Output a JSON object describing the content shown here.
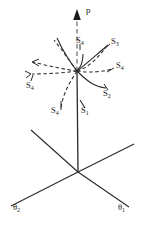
{
  "figure": {
    "background_color": "#ffffff",
    "line_color": "#2a2a2a",
    "axis_dashed_color": "#8a8a8a",
    "width": 143,
    "height": 226
  },
  "axes": [
    {
      "id": "p-axis",
      "label": "p",
      "label_sub": "",
      "kind": "vertical-arrow",
      "x": 86,
      "y": 6
    },
    {
      "id": "theta1-axis",
      "label": "θ",
      "label_sub": "1",
      "kind": "oblique-right",
      "x": 118,
      "y": 204
    },
    {
      "id": "theta2-axis",
      "label": "θ",
      "label_sub": "2",
      "kind": "oblique-left",
      "x": 14,
      "y": 204
    }
  ],
  "surface_labels": [
    {
      "id": "s4-top",
      "label": "S",
      "label_sub": "4",
      "x": 76,
      "y": 41,
      "style": "solid-pointer"
    },
    {
      "id": "s3-right",
      "label": "S",
      "label_sub": "3",
      "x": 111,
      "y": 42,
      "style": "solid-pointer"
    },
    {
      "id": "s4-right",
      "label": "S",
      "label_sub": "4",
      "x": 116,
      "y": 65,
      "style": "dashed-pointer"
    },
    {
      "id": "s2-right",
      "label": "S",
      "label_sub": "2",
      "x": 103,
      "y": 92,
      "style": "solid-pointer"
    },
    {
      "id": "s4-left",
      "label": "S",
      "label_sub": "4",
      "x": 27,
      "y": 83,
      "style": "dashed-pointer"
    },
    {
      "id": "s4-lower",
      "label": "S",
      "label_sub": "4",
      "x": 53,
      "y": 110,
      "style": "dashed-pointer"
    },
    {
      "id": "s1-lower",
      "label": "S",
      "label_sub": "1",
      "x": 81,
      "y": 110,
      "style": "solid-pointer"
    }
  ],
  "geometry": {
    "origin": {
      "x": 78,
      "y": 172
    },
    "intersection": {
      "x": 77,
      "y": 71
    },
    "arrow_tip": {
      "x": 77,
      "y": 10
    }
  }
}
